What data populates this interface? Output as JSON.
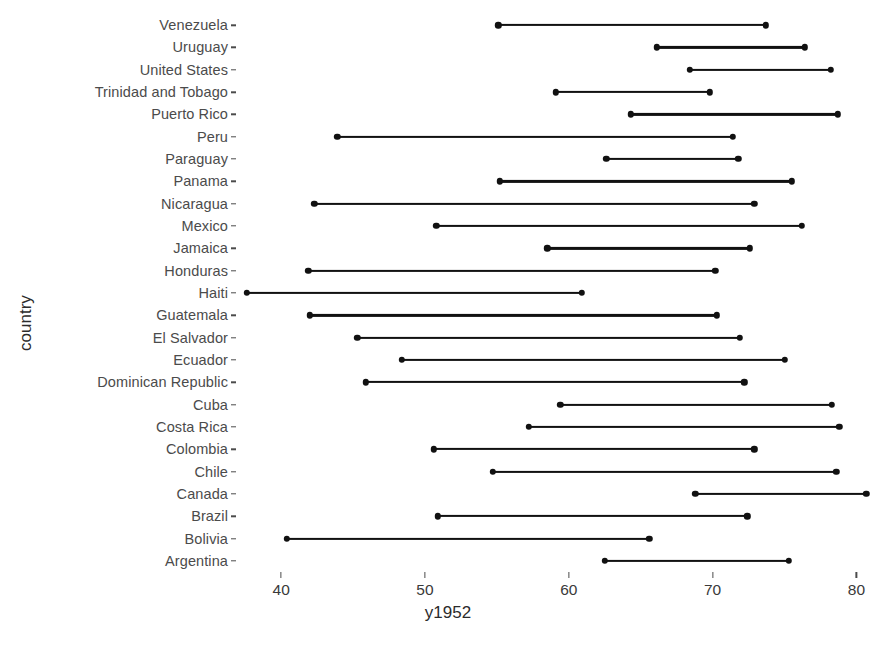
{
  "chart_data": {
    "type": "dumbbell",
    "title": "",
    "xlabel": "y1952",
    "ylabel": "country",
    "xlim": [
      37.0,
      81.5
    ],
    "xticks": [
      40,
      50,
      60,
      70,
      80
    ],
    "xtick_labels": [
      "40",
      "50",
      "60",
      "70",
      "80"
    ],
    "grid": false,
    "legend": false,
    "series": [
      {
        "name": "y1952"
      },
      {
        "name": "y2007"
      }
    ],
    "categories": [
      "Venezuela",
      "Uruguay",
      "United States",
      "Trinidad and Tobago",
      "Puerto Rico",
      "Peru",
      "Paraguay",
      "Panama",
      "Nicaragua",
      "Mexico",
      "Jamaica",
      "Honduras",
      "Haiti",
      "Guatemala",
      "El Salvador",
      "Ecuador",
      "Dominican Republic",
      "Cuba",
      "Costa Rica",
      "Colombia",
      "Chile",
      "Canada",
      "Brazil",
      "Bolivia",
      "Argentina"
    ],
    "points": [
      {
        "country": "Venezuela",
        "start": 55.1,
        "end": 73.7
      },
      {
        "country": "Uruguay",
        "start": 66.1,
        "end": 76.4
      },
      {
        "country": "United States",
        "start": 68.4,
        "end": 78.2
      },
      {
        "country": "Trinidad and Tobago",
        "start": 59.1,
        "end": 69.8
      },
      {
        "country": "Puerto Rico",
        "start": 64.3,
        "end": 78.7
      },
      {
        "country": "Peru",
        "start": 43.9,
        "end": 71.4
      },
      {
        "country": "Paraguay",
        "start": 62.6,
        "end": 71.8
      },
      {
        "country": "Panama",
        "start": 55.2,
        "end": 75.5
      },
      {
        "country": "Nicaragua",
        "start": 42.3,
        "end": 72.9
      },
      {
        "country": "Mexico",
        "start": 50.8,
        "end": 76.2
      },
      {
        "country": "Jamaica",
        "start": 58.5,
        "end": 72.6
      },
      {
        "country": "Honduras",
        "start": 41.9,
        "end": 70.2
      },
      {
        "country": "Haiti",
        "start": 37.6,
        "end": 60.9
      },
      {
        "country": "Guatemala",
        "start": 42.0,
        "end": 70.3
      },
      {
        "country": "El Salvador",
        "start": 45.3,
        "end": 71.9
      },
      {
        "country": "Ecuador",
        "start": 48.4,
        "end": 75.0
      },
      {
        "country": "Dominican Republic",
        "start": 45.9,
        "end": 72.2
      },
      {
        "country": "Cuba",
        "start": 59.4,
        "end": 78.3
      },
      {
        "country": "Costa Rica",
        "start": 57.2,
        "end": 78.8
      },
      {
        "country": "Colombia",
        "start": 50.6,
        "end": 72.9
      },
      {
        "country": "Chile",
        "start": 54.7,
        "end": 78.6
      },
      {
        "country": "Canada",
        "start": 68.8,
        "end": 80.7
      },
      {
        "country": "Brazil",
        "start": 50.9,
        "end": 72.4
      },
      {
        "country": "Bolivia",
        "start": 40.4,
        "end": 65.6
      },
      {
        "country": "Argentina",
        "start": 62.5,
        "end": 75.3
      }
    ],
    "colors": {
      "line": "#111111",
      "dot": "#111111",
      "axis_text": "#4b4b4b",
      "title_text": "#2b2b2b",
      "background": "#ffffff"
    }
  }
}
